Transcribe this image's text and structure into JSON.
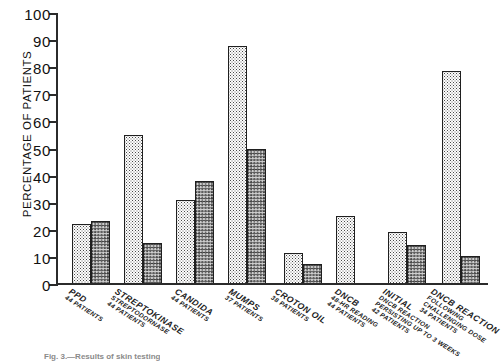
{
  "chart_data": {
    "type": "bar",
    "title": "",
    "xlabel": "",
    "ylabel": "PERCENTAGE OF PATIENTS",
    "ylim": [
      0,
      100
    ],
    "ytick_labels": [
      "100",
      "90",
      "80",
      "70",
      "60",
      "50",
      "40",
      "30",
      "20",
      "10",
      "0"
    ],
    "ytick_values": [
      100,
      90,
      80,
      70,
      60,
      50,
      40,
      30,
      20,
      10,
      0
    ],
    "grid": false,
    "legend": "none",
    "categories": [
      "PPD 44 PATIENTS",
      "STREPTOKINASE STREPTODORNASE 44 PATIENTS",
      "CANDIDA 44 PATIENTS",
      "MUMPS 37 PATIENTS",
      "CROTON OIL 38 PATIENTS",
      "DNCB 48-HR READING 44 PATIENTS",
      "INITIAL DNCB REACTION PERSISTING UP TO 3 WEEKS 42 PATIENTS",
      "DNCB REACTION FOLLOWING CHALLENGING DOSE 34 PATIENTS"
    ],
    "series": [
      {
        "name": "light-stipple",
        "values": [
          22,
          55,
          31,
          88,
          11,
          25,
          19,
          79
        ]
      },
      {
        "name": "dark-crosshatch",
        "values": [
          23,
          15,
          38,
          50,
          7,
          null,
          14,
          10
        ]
      }
    ]
  },
  "axis": {
    "ylabel": "PERCENTAGE OF PATIENTS",
    "ticks": [
      {
        "label": "100",
        "value": 100
      },
      {
        "label": "90",
        "value": 90
      },
      {
        "label": "80",
        "value": 80
      },
      {
        "label": "70",
        "value": 70
      },
      {
        "label": "60",
        "value": 60
      },
      {
        "label": "50",
        "value": 50
      },
      {
        "label": "40",
        "value": 40
      },
      {
        "label": "30",
        "value": 30
      },
      {
        "label": "20",
        "value": 20
      },
      {
        "label": "10",
        "value": 10
      },
      {
        "label": "0",
        "value": 0
      }
    ]
  },
  "groups": [
    {
      "id": "ppd",
      "lines": [
        "PPD",
        "44 PATIENTS",
        "",
        ""
      ],
      "light": 22,
      "dark": 23
    },
    {
      "id": "streptokinase",
      "lines": [
        "STREPTOKINASE",
        "STREPTODORNASE",
        "44 PATIENTS",
        ""
      ],
      "light": 55,
      "dark": 15
    },
    {
      "id": "candida",
      "lines": [
        "CANDIDA",
        "44 PATIENTS",
        "",
        ""
      ],
      "light": 31,
      "dark": 38
    },
    {
      "id": "mumps",
      "lines": [
        "MUMPS",
        "37 PATIENTS",
        "",
        ""
      ],
      "light": 88,
      "dark": 50
    },
    {
      "id": "croton-oil",
      "lines": [
        "CROTON OIL",
        "38 PATIENTS",
        "",
        ""
      ],
      "light": 11,
      "dark": 7
    },
    {
      "id": "dncb-48hr",
      "lines": [
        "DNCB",
        "48-HR READING",
        "44 PATIENTS",
        ""
      ],
      "light": 25,
      "dark": null
    },
    {
      "id": "dncb-persisting",
      "lines": [
        "INITIAL",
        "DNCB REACTION",
        "PERSISTING UP TO 3 WEEKS",
        "42 PATIENTS"
      ],
      "light": 19,
      "dark": 14
    },
    {
      "id": "dncb-challenge",
      "lines": [
        "DNCB REACTION",
        "FOLLOWING",
        "CHALLENGING DOSE",
        "34 PATIENTS"
      ],
      "light": 79,
      "dark": 10
    }
  ],
  "caption": {
    "text": "Fig. 3.—Results of skin testing"
  },
  "colors": {
    "axis": "#2b2b2b",
    "bar_outline": "#1f1f1f",
    "light_fill": "#fdfdfd",
    "dark_fill": "#cfcfcf",
    "text": "#111111",
    "background": "#ffffff"
  }
}
